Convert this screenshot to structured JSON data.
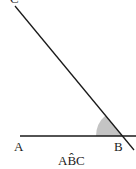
{
  "diagram": {
    "type": "angle",
    "points": {
      "A": {
        "label": "A",
        "x": 18,
        "y": 140
      },
      "B": {
        "label": "B",
        "x": 123,
        "y": 136
      },
      "C": {
        "label": "C",
        "x": 8,
        "y": -2
      }
    },
    "angle_label": "AB̂C",
    "colors": {
      "line": "#1a1a1a",
      "arc_fill": "#c4c4c4",
      "text": "#222222"
    }
  }
}
